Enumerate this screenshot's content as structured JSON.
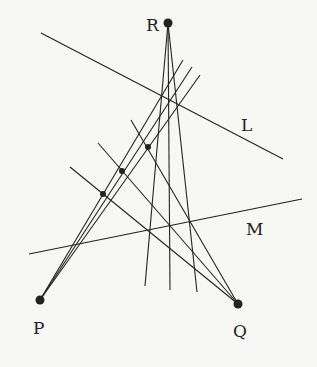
{
  "diagram": {
    "points": [
      {
        "id": "R",
        "label": "R",
        "x": 168,
        "y": 23,
        "lx": 146,
        "ly": 31
      },
      {
        "id": "P",
        "label": "P",
        "x": 40,
        "y": 300,
        "lx": 33,
        "ly": 334
      },
      {
        "id": "Q",
        "label": "Q",
        "x": 238,
        "y": 304,
        "lx": 233,
        "ly": 337
      }
    ],
    "lines": [
      {
        "id": "L",
        "label": "L",
        "x1": 41,
        "y1": 33,
        "x2": 283,
        "y2": 159,
        "lx": 241,
        "ly": 131
      },
      {
        "id": "M",
        "label": "M",
        "x1": 29,
        "y1": 254,
        "x2": 302,
        "y2": 199,
        "lx": 246,
        "ly": 235
      }
    ],
    "rays_from_R": [
      {
        "x2": 145,
        "y2": 286
      },
      {
        "x2": 170,
        "y2": 290
      },
      {
        "x2": 197,
        "y2": 292
      }
    ],
    "rays_from_P": [
      {
        "x2": 183,
        "y2": 60
      },
      {
        "x2": 192,
        "y2": 67
      },
      {
        "x2": 200,
        "y2": 75
      }
    ],
    "rays_from_Q": [
      {
        "x2": 70,
        "y2": 167
      },
      {
        "x2": 98,
        "y2": 143
      },
      {
        "x2": 131,
        "y2": 120
      }
    ],
    "intersection_dots": [
      {
        "x": 148,
        "y": 147
      },
      {
        "x": 122,
        "y": 171
      },
      {
        "x": 103,
        "y": 194
      }
    ],
    "colors": {
      "stroke": "#222222",
      "background": "#f7f7f5"
    }
  }
}
